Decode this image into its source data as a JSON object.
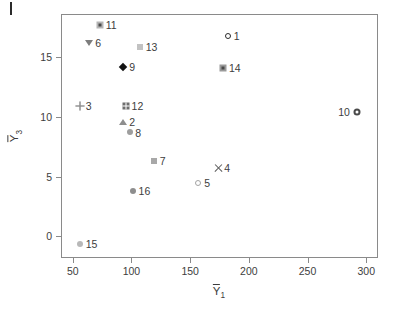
{
  "chart_data": {
    "type": "scatter",
    "title": "",
    "xlabel": "Ȳ1",
    "ylabel": "Ȳ3",
    "xlabel_base": "Y",
    "xlabel_sub": "1",
    "ylabel_base": "Y",
    "ylabel_sub": "3",
    "xlim": [
      40,
      310
    ],
    "ylim": [
      -1.8,
      18.6
    ],
    "xticks": [
      50,
      100,
      150,
      200,
      250,
      300
    ],
    "yticks": [
      0,
      5,
      10,
      15
    ],
    "grid": false,
    "legend": "none",
    "points": [
      {
        "label": "1",
        "x": 182,
        "y": 16.8,
        "marker": "circle-open",
        "color": "#2b2b2b",
        "label_pos": "right"
      },
      {
        "label": "2",
        "x": 93,
        "y": 9.6,
        "marker": "triangle-up",
        "color": "#8e8e8e",
        "label_pos": "right"
      },
      {
        "label": "3",
        "x": 56,
        "y": 10.9,
        "marker": "plus",
        "color": "#9a9a9a",
        "label_pos": "right"
      },
      {
        "label": "4",
        "x": 174,
        "y": 5.7,
        "marker": "times",
        "color": "#5a5a5a",
        "label_pos": "right"
      },
      {
        "label": "5",
        "x": 157,
        "y": 4.5,
        "marker": "circle-open",
        "color": "#a3a3a3",
        "label_pos": "right"
      },
      {
        "label": "6",
        "x": 64,
        "y": 16.2,
        "marker": "triangle-down",
        "color": "#7d7d7d",
        "label_pos": "right"
      },
      {
        "label": "7",
        "x": 119,
        "y": 6.3,
        "marker": "square",
        "color": "#a8a8a8",
        "label_pos": "right"
      },
      {
        "label": "8",
        "x": 99,
        "y": 8.7,
        "marker": "circle-fill",
        "color": "#9e9e9e",
        "label_pos": "right"
      },
      {
        "label": "9",
        "x": 93,
        "y": 14.2,
        "marker": "diamond",
        "color": "#131313",
        "label_pos": "right"
      },
      {
        "label": "10",
        "x": 292,
        "y": 10.4,
        "marker": "circle-dot",
        "color": "#4a4a4a",
        "label_pos": "left"
      },
      {
        "label": "11",
        "x": 73,
        "y": 17.7,
        "marker": "square-dot",
        "color": "#b5b5b5",
        "label_pos": "right"
      },
      {
        "label": "12",
        "x": 95,
        "y": 10.9,
        "marker": "square-grid",
        "color": "#6e6e6e",
        "label_pos": "right"
      },
      {
        "label": "13",
        "x": 107,
        "y": 15.8,
        "marker": "square",
        "color": "#c2c2c2",
        "label_pos": "right"
      },
      {
        "label": "14",
        "x": 178,
        "y": 14.1,
        "marker": "square-dot",
        "color": "#9a9a9a",
        "label_pos": "right"
      },
      {
        "label": "15",
        "x": 56,
        "y": -0.6,
        "marker": "circle-fill",
        "color": "#b8b8b8",
        "label_pos": "right"
      },
      {
        "label": "16",
        "x": 101,
        "y": 3.8,
        "marker": "circle-fill",
        "color": "#8e8e8e",
        "label_pos": "right"
      }
    ]
  },
  "axes": {
    "x_tick_labels": [
      "50",
      "100",
      "150",
      "200",
      "250",
      "300"
    ],
    "y_tick_labels": [
      "0",
      "5",
      "10",
      "15"
    ]
  },
  "colors": {
    "frame": "#8a8a8a",
    "text": "#3d3d3d",
    "background": "#ffffff"
  }
}
